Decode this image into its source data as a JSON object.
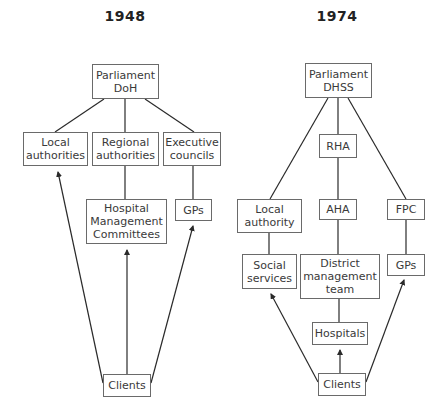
{
  "diagrams": [
    {
      "title": "1948",
      "nodes": {
        "parliament": "Parliament\nDoH",
        "local_authorities": "Local\nauthorities",
        "regional_authorities": "Regional\nauthorities",
        "executive_councils": "Executive\ncouncils",
        "hmc": "Hospital\nManagement\nCommittees",
        "gps": "GPs",
        "clients": "Clients"
      }
    },
    {
      "title": "1974",
      "nodes": {
        "parliament": "Parliament\nDHSS",
        "rha": "RHA",
        "aha": "AHA",
        "fpc": "FPC",
        "local_authority": "Local\nauthority",
        "social_services": "Social\nservices",
        "dmt": "District\nmanagement\nteam",
        "gps": "GPs",
        "hospitals": "Hospitals",
        "clients": "Clients"
      }
    }
  ],
  "colors": {
    "line": "#2a2a2a",
    "box_border": "#6a6a6a",
    "text": "#3a3a3a"
  }
}
